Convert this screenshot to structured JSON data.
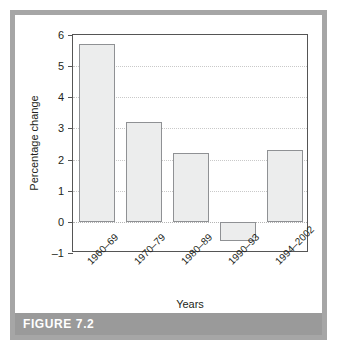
{
  "figure": {
    "caption": "FIGURE 7.2"
  },
  "chart_data": {
    "type": "bar",
    "title": "",
    "xlabel": "Years",
    "ylabel": "Percentage change",
    "categories": [
      "1960–69",
      "1970–79",
      "1980–89",
      "1990–93",
      "1994–2002"
    ],
    "values": [
      5.7,
      3.2,
      2.2,
      -0.6,
      2.3
    ],
    "ylim": [
      -1,
      6
    ],
    "yticks": [
      -1,
      0,
      1,
      2,
      3,
      4,
      5,
      6
    ],
    "ytick_labels": [
      "–1",
      "0",
      "1",
      "2",
      "3",
      "4",
      "5",
      "6"
    ],
    "grid": true,
    "legend": false,
    "bar_fill_color": "#eceded",
    "bar_edge_color": "#8f9194"
  }
}
